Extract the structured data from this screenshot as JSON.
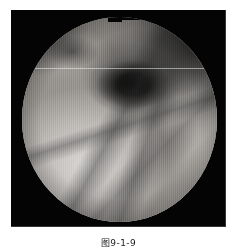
{
  "page": {
    "background_color": "#ffffff",
    "width": 237,
    "height": 248
  },
  "figure": {
    "caption": "图9-1-9",
    "caption_note": "caption clipped at bottom edge of page",
    "frame_color": "#040404",
    "modality_label": "endoscopic-photograph",
    "color_mode": "grayscale"
  },
  "image": {
    "field_of_view_shape": "circle",
    "field_of_view_notch": "stepped notch at top edge",
    "scanline_artifact": "horizontal bright line across upper third",
    "texture": "vertical interlaced video scan lines",
    "regions": [
      {
        "name": "dark-lumen",
        "label": "dark central lumen opening",
        "position": "upper-centre",
        "tone": "#080808"
      },
      {
        "name": "upper-right-shadow",
        "label": "shadowed upper-right wall",
        "position": "upper-right",
        "tone": "#191919"
      },
      {
        "name": "upper-left-shadow",
        "label": "shadowed upper-left rim",
        "position": "upper-left",
        "tone": "#2a2a2a"
      },
      {
        "name": "bright-mucosa",
        "label": "bright mucosal surface",
        "position": "lower-left",
        "tone": "#d6d4d0"
      },
      {
        "name": "right-wall",
        "label": "illuminated right wall",
        "position": "right",
        "tone": "#bdbab5"
      },
      {
        "name": "fold-shadows",
        "label": "diagonal mucosal fold shadows",
        "position": "lower-right",
        "tone": "#4a4a4a"
      },
      {
        "name": "center-crease",
        "label": "diagonal crease to bottom centre",
        "position": "bottom-centre",
        "tone": "#555555"
      }
    ]
  }
}
